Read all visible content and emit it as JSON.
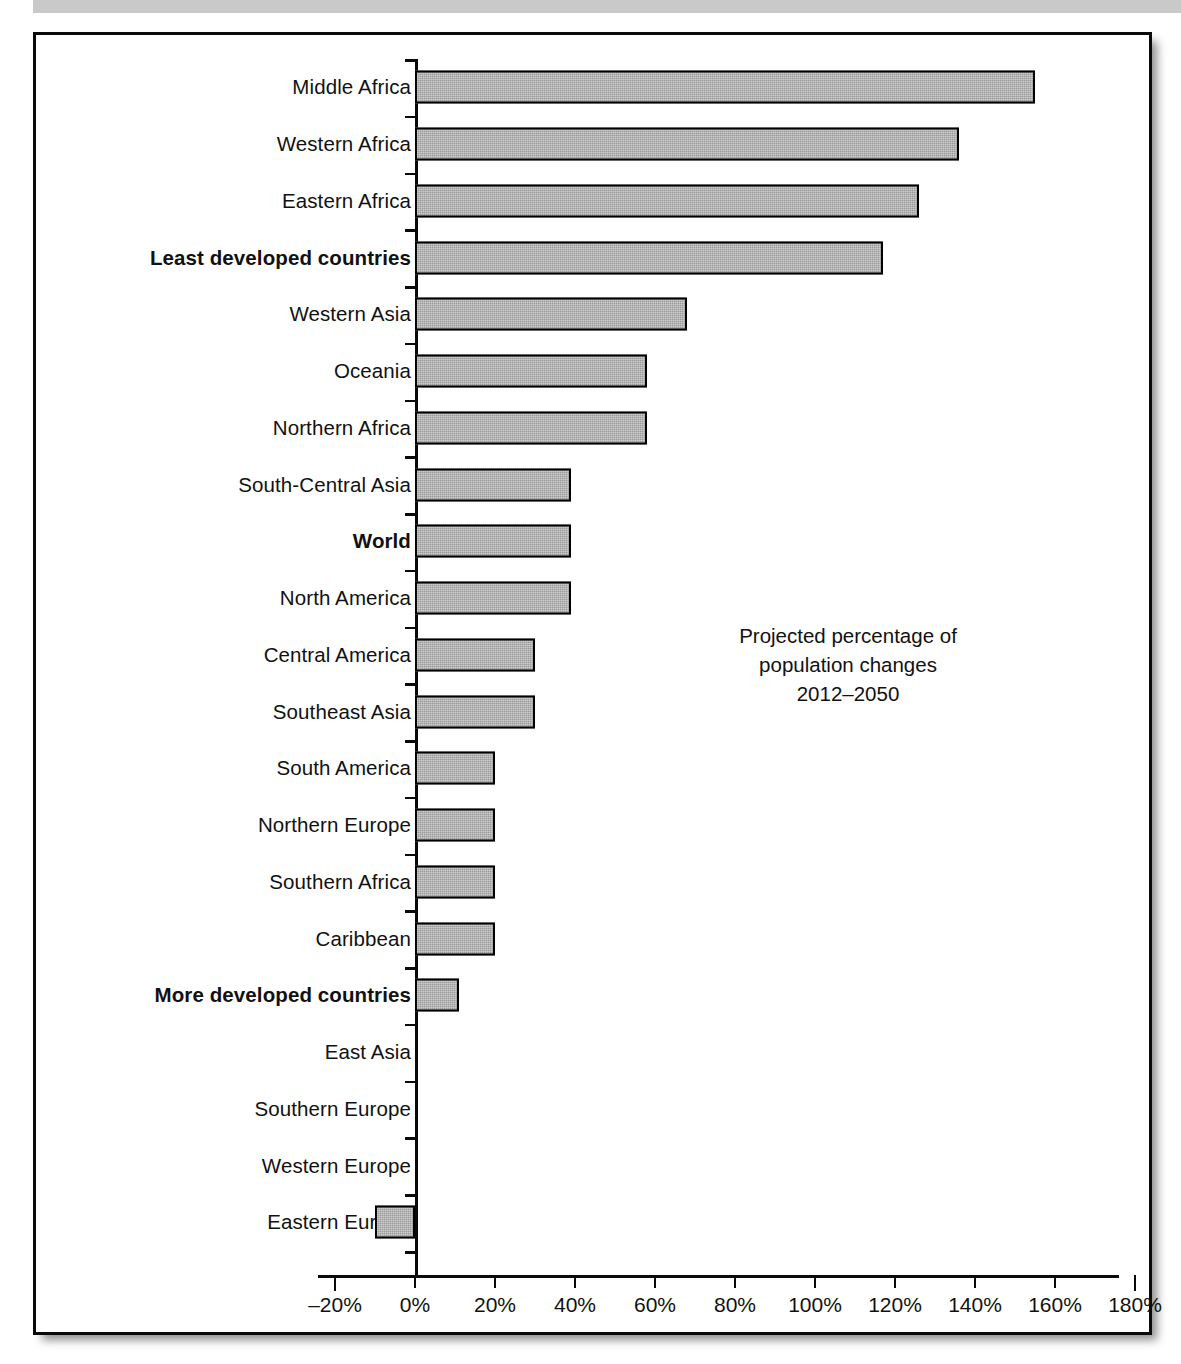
{
  "figure": {
    "annotation_lines": [
      "Projected percentage of",
      "population changes",
      "2012–2050"
    ]
  },
  "axis": {
    "x_tick_labels": [
      "-20%",
      "0%",
      "20%",
      "40%",
      "60%",
      "80%",
      "100%",
      "120%",
      "140%",
      "160%",
      "180%"
    ],
    "x_min": -20,
    "x_max": 180,
    "x_step": 20
  },
  "colors": {
    "bar_fill": "#9a9a9a",
    "bar_border": "#000000",
    "frame_border": "#0a0a0a",
    "top_band": "#c9c9c9",
    "text": "#111111"
  },
  "chart_data": {
    "type": "bar",
    "orientation": "horizontal",
    "title": "Projected percentage of population changes 2012–2050",
    "xlabel": "",
    "ylabel": "",
    "xlim": [
      -20,
      180
    ],
    "grid": false,
    "legend": "none",
    "annotation": "Projected percentage of population changes 2012–2050",
    "units": "percent",
    "categories": [
      "Middle Africa",
      "Western Africa",
      "Eastern Africa",
      "Least developed countries",
      "Western Asia",
      "Oceania",
      "Northern Africa",
      "South-Central Asia",
      "World",
      "North America",
      "Central America",
      "Southeast Asia",
      "South America",
      "Northern Europe",
      "Southern Africa",
      "Caribbean",
      "More developed countries",
      "East Asia",
      "Southern Europe",
      "Western Europe",
      "Eastern Europe"
    ],
    "values": [
      155,
      136,
      126,
      117,
      68,
      58,
      58,
      39,
      39,
      39,
      30,
      30,
      20,
      20,
      20,
      20,
      11,
      0,
      0,
      0,
      -10
    ],
    "emphasized": [
      "Least developed countries",
      "World",
      "More developed countries"
    ],
    "rows": [
      {
        "label": "Middle Africa",
        "value": 155,
        "bold": false
      },
      {
        "label": "Western Africa",
        "value": 136,
        "bold": false
      },
      {
        "label": "Eastern Africa",
        "value": 126,
        "bold": false
      },
      {
        "label": "Least developed countries",
        "value": 117,
        "bold": true
      },
      {
        "label": "Western Asia",
        "value": 68,
        "bold": false
      },
      {
        "label": "Oceania",
        "value": 58,
        "bold": false
      },
      {
        "label": "Northern Africa",
        "value": 58,
        "bold": false
      },
      {
        "label": "South-Central Asia",
        "value": 39,
        "bold": false
      },
      {
        "label": "World",
        "value": 39,
        "bold": true
      },
      {
        "label": "North America",
        "value": 39,
        "bold": false
      },
      {
        "label": "Central America",
        "value": 30,
        "bold": false
      },
      {
        "label": "Southeast Asia",
        "value": 30,
        "bold": false
      },
      {
        "label": "South America",
        "value": 20,
        "bold": false
      },
      {
        "label": "Northern Europe",
        "value": 20,
        "bold": false
      },
      {
        "label": "Southern Africa",
        "value": 20,
        "bold": false
      },
      {
        "label": "Caribbean",
        "value": 20,
        "bold": false
      },
      {
        "label": "More developed countries",
        "value": 11,
        "bold": true
      },
      {
        "label": "East Asia",
        "value": 0,
        "bold": false
      },
      {
        "label": "Southern Europe",
        "value": 0,
        "bold": false
      },
      {
        "label": "Western Europe",
        "value": 0,
        "bold": false
      },
      {
        "label": "Eastern Europe",
        "value": -10,
        "bold": false
      }
    ]
  }
}
